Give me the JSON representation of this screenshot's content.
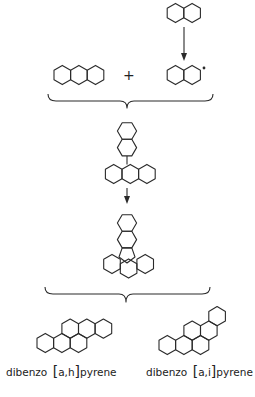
{
  "diagram": {
    "type": "reaction-scheme",
    "steps": [
      {
        "name": "naphthalene",
        "role": "reactant"
      },
      {
        "name": "naphthyl radical",
        "role": "intermediate"
      },
      {
        "name": "anthracene",
        "role": "reactant"
      },
      {
        "name": "naphthyl-anthracene adduct",
        "role": "intermediate"
      },
      {
        "name": "cyclized pentagon-fused intermediate",
        "role": "intermediate"
      },
      {
        "name": "dibenzo[a,h]pyrene",
        "role": "product"
      },
      {
        "name": "dibenzo[a,i]pyrene",
        "role": "product"
      }
    ],
    "operators": {
      "plus": "+"
    },
    "radical_dot": "•",
    "labels": {
      "product_left_prefix": "dibenzo",
      "product_left_locant": "a,h",
      "product_left_suffix": "pyrene",
      "product_right_prefix": "dibenzo",
      "product_right_locant": "a,i",
      "product_right_suffix": "pyrene"
    },
    "colors": {
      "line": "#2a2a2a",
      "background": "#ffffff"
    }
  }
}
